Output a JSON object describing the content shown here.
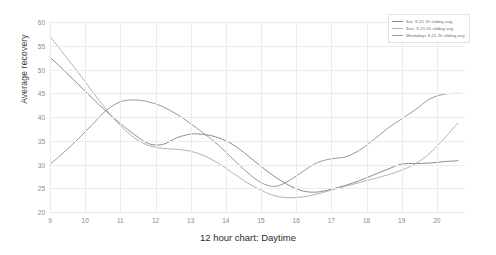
{
  "chart_data": {
    "type": "line",
    "title": "",
    "xlabel": "12 hour chart: Daytime",
    "ylabel": "Average recovery",
    "xlim": [
      9,
      20.8
    ],
    "ylim": [
      20,
      60
    ],
    "grid": true,
    "legend_position": "top-right",
    "x_ticks": [
      "9",
      "10",
      "11",
      "12",
      "13",
      "14",
      "15",
      "16",
      "17",
      "18",
      "19",
      "20"
    ],
    "y_ticks": [
      "20",
      "25",
      "30",
      "35",
      "40",
      "45",
      "50",
      "55",
      "60"
    ],
    "series": [
      {
        "name": "Sat. 9-21 2h sliding avg",
        "color": "#8c8c8c",
        "x": [
          9,
          9.4,
          9.8,
          10.2,
          10.6,
          11,
          11.4,
          11.8,
          12.2,
          12.6,
          13,
          13.4,
          13.8,
          14.2,
          14.6,
          15,
          15.4,
          15.8,
          16.2,
          16.6,
          17,
          17.4,
          17.8,
          18.2,
          18.6,
          19,
          19.4,
          19.8,
          20.2,
          20.6
        ],
        "y": [
          52.6,
          49.8,
          46.9,
          44.0,
          41.2,
          38.6,
          36.3,
          34.4,
          34.2,
          35.6,
          36.4,
          36.3,
          35.6,
          34.2,
          32.0,
          29.6,
          27.4,
          25.6,
          24.4,
          24.2,
          24.8,
          25.6,
          26.6,
          27.8,
          29.0,
          30.1,
          30.2,
          30.3,
          30.6,
          30.8
        ]
      },
      {
        "name": "Sun. 9-21 2h sliding avg",
        "color": "#b3b3b3",
        "x": [
          9,
          9.4,
          9.8,
          10.2,
          10.6,
          11,
          11.4,
          11.8,
          12.2,
          12.6,
          13,
          13.4,
          13.8,
          14.2,
          14.6,
          15,
          15.4,
          15.8,
          16.2,
          16.6,
          17,
          17.4,
          17.8,
          18.2,
          18.6,
          19,
          19.4,
          19.8,
          20.2,
          20.6
        ],
        "y": [
          57.0,
          53.2,
          49.4,
          45.4,
          41.6,
          38.2,
          35.6,
          34.0,
          33.4,
          33.2,
          32.8,
          31.8,
          30.2,
          28.2,
          26.2,
          24.6,
          23.4,
          23.0,
          23.2,
          23.8,
          24.6,
          25.4,
          26.2,
          27.0,
          27.8,
          28.8,
          30.2,
          32.4,
          35.4,
          38.8
        ]
      },
      {
        "name": "Weekdays 9-21 2h sliding avg",
        "color": "#9a9a9a",
        "x": [
          9,
          9.4,
          9.8,
          10.2,
          10.6,
          11,
          11.4,
          11.8,
          12.2,
          12.6,
          13,
          13.4,
          13.8,
          14.2,
          14.6,
          15,
          15.4,
          15.8,
          16.2,
          16.6,
          17,
          17.4,
          17.8,
          18.2,
          18.6,
          19,
          19.4,
          19.8,
          20.2,
          20.6
        ],
        "y": [
          30.0,
          32.6,
          35.4,
          38.4,
          41.4,
          43.2,
          43.6,
          43.2,
          42.2,
          40.6,
          38.6,
          36.4,
          34.0,
          31.2,
          28.4,
          26.2,
          25.4,
          26.6,
          28.6,
          30.4,
          31.2,
          31.6,
          33.0,
          35.2,
          37.6,
          39.6,
          41.6,
          43.8,
          44.8,
          45.0
        ]
      }
    ]
  }
}
